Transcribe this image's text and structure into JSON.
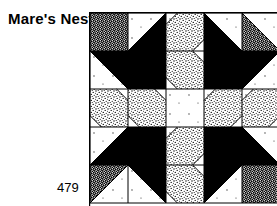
{
  "page": {
    "title": "Mare's Nest",
    "page_number": "479"
  },
  "block": {
    "name": "Mare's Nest",
    "grid_rows": 5,
    "grid_cols": 5,
    "cell_px": 38,
    "origin_x": 89,
    "origin_y": 12,
    "colors": {
      "solid": "#000000",
      "background": "#ffffff",
      "stipple_light": "#e8e8e8",
      "stipple_dense": "#4a4a4a",
      "line": "#000000"
    },
    "fabrics": [
      {
        "key": "white",
        "label": "white"
      },
      {
        "key": "black",
        "label": "solid black"
      },
      {
        "key": "light",
        "label": "light stipple print"
      },
      {
        "key": "dense",
        "label": "dense stipple print"
      }
    ],
    "cells": [
      [
        {
          "pattern": "full",
          "fill": "dense"
        },
        {
          "pattern": "tri-br",
          "fill": "black"
        },
        {
          "pattern": "band-nwse",
          "fill": "light"
        },
        {
          "pattern": "tri-bl",
          "fill": "black"
        },
        {
          "pattern": "tri-bl",
          "fill": "dense"
        }
      ],
      [
        {
          "pattern": "tri-tr",
          "fill": "black"
        },
        {
          "pattern": "full",
          "fill": "black"
        },
        {
          "pattern": "band-swne",
          "fill": "light"
        },
        {
          "pattern": "full",
          "fill": "black"
        },
        {
          "pattern": "tri-tl",
          "fill": "black"
        }
      ],
      [
        {
          "pattern": "band-swne",
          "fill": "light"
        },
        {
          "pattern": "band-swne",
          "fill": "light"
        },
        {
          "pattern": "full",
          "fill": "white"
        },
        {
          "pattern": "band-nwse",
          "fill": "light"
        },
        {
          "pattern": "band-nwse",
          "fill": "light"
        }
      ],
      [
        {
          "pattern": "tri-br",
          "fill": "black"
        },
        {
          "pattern": "full",
          "fill": "black"
        },
        {
          "pattern": "band-nwse",
          "fill": "light"
        },
        {
          "pattern": "full",
          "fill": "black"
        },
        {
          "pattern": "tri-bl",
          "fill": "black"
        }
      ],
      [
        {
          "pattern": "tri-tl",
          "fill": "dense"
        },
        {
          "pattern": "tri-tr",
          "fill": "black"
        },
        {
          "pattern": "band-swne",
          "fill": "light"
        },
        {
          "pattern": "tri-tl",
          "fill": "black"
        },
        {
          "pattern": "full",
          "fill": "dense"
        }
      ]
    ]
  }
}
